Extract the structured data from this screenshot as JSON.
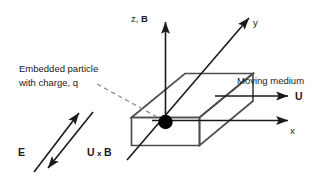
{
  "figure": {
    "name": "moving-medium-charge-diagram",
    "background_color": "#ffffff",
    "line_color": "#1a1a1a",
    "slab_edge_color": "#4d4d4d",
    "particle_color": "#000000",
    "dashed_color": "#7a7a7a"
  },
  "axes": {
    "z_label": "z, ",
    "z_label_bold": "B",
    "y_label": "y",
    "x_label": "x"
  },
  "annotations": {
    "particle_line1": "Embedded particle",
    "particle_line2": "with charge, q",
    "medium_label": "Moving medium",
    "velocity_label": "U",
    "e_field_label": "E",
    "uxb_label_u": "U",
    "uxb_label_times": "x",
    "uxb_label_b": "B"
  }
}
